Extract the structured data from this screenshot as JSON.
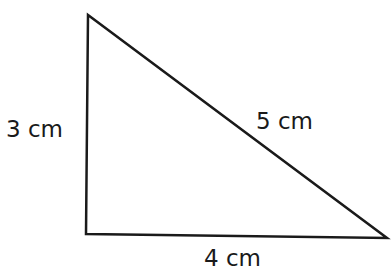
{
  "diagram": {
    "type": "right-triangle",
    "vertices": {
      "top": [
        88,
        15
      ],
      "bottom_left": [
        86,
        234
      ],
      "bottom_right": [
        387,
        238
      ]
    },
    "stroke_color": "#1a1a1a",
    "labels": {
      "left_side": "3 cm",
      "hypotenuse": "5 cm",
      "bottom_side": "4 cm"
    }
  }
}
